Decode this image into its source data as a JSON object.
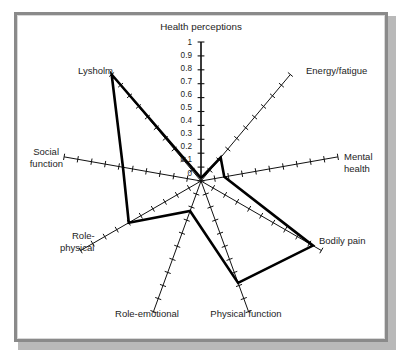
{
  "figure": {
    "frame_color": "#8a8a8a",
    "background": "#ffffff",
    "line_color": "#000000"
  },
  "chart_data": {
    "type": "radar",
    "title": "Health perceptions",
    "xlabel": "",
    "ylabel": "",
    "ylim": [
      0,
      1
    ],
    "grid": false,
    "legend": "none",
    "tick_labels": [
      "0",
      "0.1",
      "0.2",
      "0.3",
      "0.4",
      "0.5",
      "0.6",
      "0.7",
      "0.8",
      "0.9",
      "1"
    ],
    "tick_values": [
      0,
      0.1,
      0.2,
      0.3,
      0.4,
      0.5,
      0.6,
      0.7,
      0.8,
      0.9,
      1
    ],
    "axis_tick_count": 10,
    "categories": [
      "Health perceptions",
      "Energy/fatigue",
      "Mental health",
      "Bodily pain",
      "Physical function",
      "Role-emotional",
      "Role-physical",
      "Social function",
      "Lysholm"
    ],
    "series": [
      {
        "name": "Score",
        "values": [
          0.02,
          0.22,
          0.17,
          0.93,
          0.78,
          0.23,
          0.6,
          0.57,
          1.0
        ]
      }
    ],
    "annotations": []
  },
  "labels": {
    "health_perceptions": "Health perceptions",
    "energy_fatigue": "Energy/fatigue",
    "mental_health_line1": "Mental",
    "mental_health_line2": "health",
    "bodily_pain": "Bodily pain",
    "physical_function": "Physical function",
    "role_emotional": "Role-emotional",
    "role_physical_line1": "Role-",
    "role_physical_line2": "physical",
    "social_function_line1": "Social",
    "social_function_line2": "function",
    "lysholm": "Lysholm"
  },
  "ticks": {
    "t0": "0",
    "t1": "0.1",
    "t2": "0.2",
    "t3": "0.3",
    "t4": "0.4",
    "t5": "0.5",
    "t6": "0.6",
    "t7": "0.7",
    "t8": "0.8",
    "t9": "0.9",
    "t10": "1"
  }
}
